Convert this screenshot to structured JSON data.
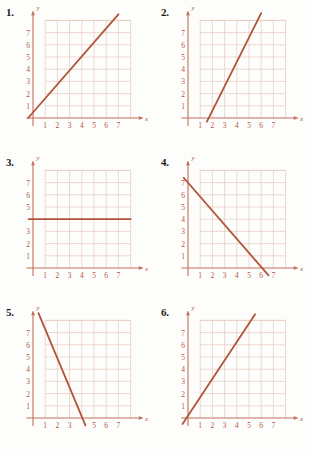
{
  "page": {
    "background_color": "#fdfdfc",
    "grid_color": "#e8c9bd",
    "axis_color": "#c4705a",
    "line_color": "#b0543a",
    "label_color": "#b5563a",
    "number_color": "#1d1b19"
  },
  "axes": {
    "x_label": "x",
    "y_label": "y",
    "x_ticks": [
      "1",
      "2",
      "3",
      "4",
      "5",
      "6",
      "7"
    ],
    "y_ticks": [
      "7",
      "6",
      "5",
      "4",
      "3",
      "2",
      "1"
    ],
    "x_range": [
      0,
      8
    ],
    "y_range": [
      0,
      8
    ],
    "grid": true
  },
  "panels": [
    {
      "number": "1.",
      "chart_data": {
        "type": "line",
        "title": "1.",
        "xlabel": "x",
        "ylabel": "y",
        "xlim": [
          0,
          8
        ],
        "ylim": [
          0,
          8
        ],
        "grid": true,
        "xtick_labels": [
          "1",
          "2",
          "3",
          "4",
          "5",
          "6",
          "7"
        ],
        "ytick_labels": [
          "1",
          "2",
          "3",
          "4",
          "5",
          "6",
          "7"
        ],
        "series": [
          {
            "name": "line-1",
            "slope": 1.15,
            "y_intercept": 0.45,
            "x_intercept": -0.39,
            "points": [
              [
                -0.4,
                0.0
              ],
              [
                7.0,
                8.5
              ]
            ]
          }
        ]
      }
    },
    {
      "number": "2.",
      "chart_data": {
        "type": "line",
        "title": "2.",
        "xlabel": "x",
        "ylabel": "y",
        "xlim": [
          0,
          8
        ],
        "ylim": [
          0,
          8
        ],
        "grid": true,
        "xtick_labels": [
          "1",
          "2",
          "3",
          "4",
          "5",
          "6",
          "7"
        ],
        "ytick_labels": [
          "1",
          "2",
          "3",
          "4",
          "5",
          "6",
          "7"
        ],
        "series": [
          {
            "name": "line-2",
            "slope": 2.0,
            "y_intercept": -3.4,
            "x_intercept": 1.7,
            "points": [
              [
                1.55,
                -0.3
              ],
              [
                6.0,
                8.6
              ]
            ]
          }
        ]
      }
    },
    {
      "number": "3.",
      "chart_data": {
        "type": "line",
        "title": "3.",
        "xlabel": "x",
        "ylabel": "y",
        "xlim": [
          0,
          8
        ],
        "ylim": [
          0,
          8
        ],
        "grid": true,
        "xtick_labels": [
          "1",
          "2",
          "3",
          "4",
          "5",
          "6",
          "7"
        ],
        "ytick_labels": [
          "1",
          "2",
          "3",
          "5",
          "6",
          "7"
        ],
        "series": [
          {
            "name": "line-3",
            "slope": 0,
            "y_intercept": 4,
            "x_intercept": null,
            "points": [
              [
                -0.35,
                4.0
              ],
              [
                8.0,
                4.0
              ]
            ]
          }
        ]
      }
    },
    {
      "number": "4.",
      "chart_data": {
        "type": "line",
        "title": "4.",
        "xlabel": "x",
        "ylabel": "y",
        "xlim": [
          0,
          8
        ],
        "ylim": [
          0,
          8
        ],
        "grid": true,
        "xtick_labels": [
          "1",
          "2",
          "3",
          "4",
          "5",
          "6",
          "7"
        ],
        "ytick_labels": [
          "1",
          "2",
          "3",
          "4",
          "5",
          "6",
          "7"
        ],
        "series": [
          {
            "name": "line-4",
            "slope": -1.15,
            "y_intercept": 7.0,
            "x_intercept": 6.1,
            "points": [
              [
                -0.35,
                7.4
              ],
              [
                6.6,
                -0.6
              ]
            ]
          }
        ]
      }
    },
    {
      "number": "5.",
      "chart_data": {
        "type": "line",
        "title": "5.",
        "xlabel": "x",
        "ylabel": "y",
        "xlim": [
          0,
          8
        ],
        "ylim": [
          0,
          8
        ],
        "grid": true,
        "xtick_labels": [
          "1",
          "2",
          "3",
          "5",
          "6",
          "7"
        ],
        "ytick_labels": [
          "1",
          "2",
          "3",
          "4",
          "5",
          "6",
          "7"
        ],
        "series": [
          {
            "name": "line-5",
            "slope": -2.4,
            "y_intercept": 9.6,
            "x_intercept": 4.05,
            "points": [
              [
                0.45,
                8.6
              ],
              [
                4.3,
                -0.6
              ]
            ]
          }
        ]
      }
    },
    {
      "number": "6.",
      "chart_data": {
        "type": "line",
        "title": "6.",
        "xlabel": "x",
        "ylabel": "y",
        "xlim": [
          0,
          8
        ],
        "ylim": [
          0,
          8
        ],
        "grid": true,
        "xtick_labels": [
          "1",
          "2",
          "3",
          "4",
          "5",
          "6",
          "7"
        ],
        "ytick_labels": [
          "1",
          "2",
          "3",
          "4",
          "5",
          "6",
          "7"
        ],
        "series": [
          {
            "name": "line-6",
            "slope": 1.5,
            "y_intercept": 0.3,
            "x_intercept": -0.2,
            "points": [
              [
                -0.45,
                -0.5
              ],
              [
                5.5,
                8.5
              ]
            ]
          }
        ]
      }
    }
  ]
}
